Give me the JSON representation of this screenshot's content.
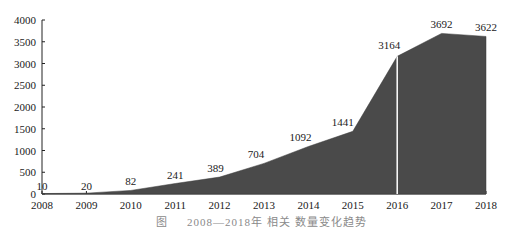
{
  "chart_data": {
    "type": "area",
    "title": "",
    "xlabel": "",
    "ylabel": "",
    "x": [
      "2008",
      "2009",
      "2010",
      "2011",
      "2012",
      "2013",
      "2014",
      "2015",
      "2016",
      "2017",
      "2018"
    ],
    "series": [
      {
        "name": "count",
        "values": [
          10,
          20,
          82,
          241,
          389,
          704,
          1092,
          1441,
          3164,
          3692,
          3622
        ]
      }
    ],
    "data_labels": [
      "10",
      "20",
      "82",
      "241",
      "389",
      "704",
      "1092",
      "1441",
      "3164",
      "3692",
      "3622"
    ],
    "ylim": [
      0,
      4000
    ],
    "yticks": [
      0,
      500,
      1000,
      1500,
      2000,
      2500,
      3000,
      3500,
      4000
    ],
    "ytick_labels": [
      "0",
      "500",
      "1000",
      "1500",
      "2000",
      "2500",
      "3000",
      "3500",
      "4000"
    ],
    "grid": false,
    "legend": null,
    "annotations": [
      "white vertical divider line at 2016"
    ],
    "fill_color": "#4a4a4a",
    "divider_color": "#ffffff"
  },
  "caption": "图 　 2008—2018年 相关 数量变化趋势"
}
